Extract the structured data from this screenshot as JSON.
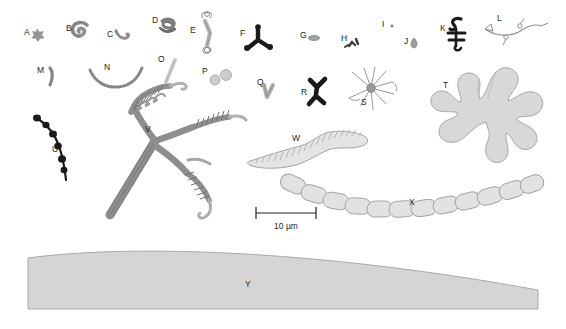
{
  "figure": {
    "background_color": "#ffffff",
    "label_color": "#231f20",
    "palette": {
      "dark_fill": "#1a1a1a",
      "mid_gray_fill": "#9a9a9a",
      "light_gray_fill": "#d8d8d8",
      "pale_fill": "#e2e2e2",
      "outline": "#808080",
      "surface_fill": "#d5d5d5",
      "surface_outline": "#a9a9a9"
    }
  },
  "scale_bar": {
    "label": "10 µm",
    "x": 256,
    "y": 213,
    "length_px": 60,
    "tick_height": 6
  },
  "specimens": [
    {
      "id": "A",
      "label": "A",
      "label_x": 24,
      "label_y": 35,
      "shape": "star-cocci-cluster",
      "fill": "#9a9a9a",
      "cx": 37,
      "cy": 33
    },
    {
      "id": "B",
      "label": "B",
      "label_x": 66,
      "label_y": 31,
      "shape": "spiral-coil",
      "fill": "#8f8f8f",
      "cx": 80,
      "cy": 30
    },
    {
      "id": "C",
      "label": "C",
      "label_x": 107,
      "label_y": 37,
      "shape": "comma-vibrio",
      "fill": "#8c8c8c",
      "cx": 120,
      "cy": 36
    },
    {
      "id": "D",
      "label": "D",
      "label_x": 152,
      "label_y": 23,
      "shape": "tangled-knot",
      "fill": "#7d7d7d",
      "cx": 167,
      "cy": 26
    },
    {
      "id": "E",
      "label": "E",
      "label_x": 190,
      "label_y": 33,
      "shape": "rod-with-tufts",
      "fill": "#a8a8a8",
      "cx": 208,
      "cy": 30
    },
    {
      "id": "F",
      "label": "F",
      "label_x": 240,
      "label_y": 36,
      "shape": "triradiate-dark",
      "fill": "#1a1a1a",
      "cx": 258,
      "cy": 38
    },
    {
      "id": "G",
      "label": "G",
      "label_x": 300,
      "label_y": 38,
      "shape": "oval-rod",
      "fill": "#a0a0a0",
      "cx": 314,
      "cy": 38
    },
    {
      "id": "H",
      "label": "H",
      "label_x": 341,
      "label_y": 41,
      "shape": "arrow-pair",
      "fill": "#3a3a3a",
      "cx": 353,
      "cy": 44
    },
    {
      "id": "I",
      "label": "I",
      "label_x": 382,
      "label_y": 27,
      "shape": "tiny-dot",
      "fill": "#7a7a7a",
      "cx": 392,
      "cy": 26
    },
    {
      "id": "J",
      "label": "J",
      "label_x": 404,
      "label_y": 44,
      "shape": "teardrop",
      "fill": "#9d9d9d",
      "cx": 414,
      "cy": 43
    },
    {
      "id": "K",
      "label": "K",
      "label_x": 440,
      "label_y": 31,
      "shape": "dark-zigzag-hook",
      "fill": "#1a1a1a",
      "cx": 456,
      "cy": 33
    },
    {
      "id": "L",
      "label": "L",
      "label_x": 497,
      "label_y": 21,
      "shape": "branched-filament-nodes",
      "fill": "#8d8d8d",
      "cx": 508,
      "cy": 32
    },
    {
      "id": "M",
      "label": "M",
      "label_x": 37,
      "label_y": 73,
      "shape": "curved-rod",
      "fill": "#8c8c8c",
      "cx": 50,
      "cy": 77
    },
    {
      "id": "N",
      "label": "N",
      "label_x": 104,
      "label_y": 70,
      "shape": "wavy-filament",
      "fill": "#8c8c8c",
      "cx": 117,
      "cy": 78
    },
    {
      "id": "O",
      "label": "O",
      "label_x": 158,
      "label_y": 62,
      "shape": "slender-rod",
      "fill": "#bdbdbd",
      "cx": 170,
      "cy": 70
    },
    {
      "id": "P",
      "label": "P",
      "label_x": 202,
      "label_y": 74,
      "shape": "diplococci",
      "fill": "#cccccc",
      "cx": 219,
      "cy": 76
    },
    {
      "id": "Q",
      "label": "Q",
      "label_x": 257,
      "label_y": 85,
      "shape": "v-shaped-rod",
      "fill": "#adadad",
      "cx": 268,
      "cy": 92
    },
    {
      "id": "R",
      "label": "R",
      "label_x": 301,
      "label_y": 95,
      "shape": "branched-dark-y",
      "fill": "#1a1a1a",
      "cx": 316,
      "cy": 88
    },
    {
      "id": "S",
      "label": "S",
      "label_x": 361,
      "label_y": 105,
      "shape": "radiating-stellate",
      "fill": "#9a9a9a",
      "cx": 371,
      "cy": 88
    },
    {
      "id": "T",
      "label": "T",
      "label_x": 443,
      "label_y": 88,
      "shape": "lobed-thallus",
      "fill": "#d8d8d8",
      "cx": 490,
      "cy": 108
    },
    {
      "id": "U",
      "label": "U",
      "label_x": 52,
      "label_y": 152,
      "shape": "beaded-chain-dark",
      "fill": "#1a1a1a",
      "cx": 62,
      "cy": 145
    },
    {
      "id": "V",
      "label": "V",
      "label_x": 145,
      "label_y": 132,
      "shape": "helical-tripod",
      "fill": "#8e8e8e",
      "cx": 160,
      "cy": 150
    },
    {
      "id": "W",
      "label": "W",
      "label_x": 292,
      "label_y": 141,
      "shape": "striated-worm",
      "fill": "#dcdcdc",
      "cx": 310,
      "cy": 152
    },
    {
      "id": "X",
      "label": "X",
      "label_x": 409,
      "label_y": 205,
      "shape": "rod-cell-chain",
      "fill": "#dcdcdc",
      "cx": 420,
      "cy": 198
    },
    {
      "id": "Y",
      "label": "Y",
      "label_x": 245,
      "label_y": 287,
      "shape": "host-surface",
      "fill": "#d5d5d5",
      "cx": 283,
      "cy": 285
    }
  ],
  "specimen_count": 25
}
